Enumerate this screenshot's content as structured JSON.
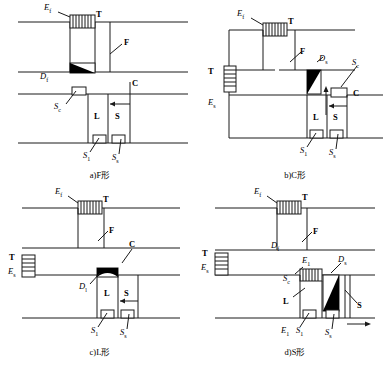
{
  "figure": {
    "title": "",
    "panel_count": 4
  },
  "panels": [
    {
      "id": "a",
      "caption": "a)F形",
      "type": "F-type",
      "labels": {
        "coil_top": "E",
        "coil_top_sub": "f",
        "transformer": "T",
        "frame": "F",
        "diode": "D",
        "diode_sub": "f",
        "sc": "S",
        "sc_sub": "c",
        "c": "C",
        "l": "L",
        "s": "S",
        "s1": "S",
        "s1_sub": "1",
        "ss": "S",
        "ss_sub": "s"
      }
    },
    {
      "id": "b",
      "caption": "b)C形",
      "type": "C-type",
      "labels": {
        "coil_top": "E",
        "coil_top_sub": "f",
        "transformer": "T",
        "frame": "F",
        "transformer_left": "T",
        "coil_left": "E",
        "coil_left_sub": "s",
        "diode": "D",
        "diode_sub": "s",
        "sc": "S",
        "sc_sub": "c",
        "c": "C",
        "l": "L",
        "s": "S",
        "s1": "S",
        "s1_sub": "1",
        "ss": "S",
        "ss_sub": "s"
      }
    },
    {
      "id": "c",
      "caption": "c)L形",
      "type": "L-type",
      "labels": {
        "coil_top": "E",
        "coil_top_sub": "f",
        "transformer": "T",
        "frame": "F",
        "transformer_left": "T",
        "coil_left": "E",
        "coil_left_sub": "s",
        "c": "C",
        "diode": "D",
        "diode_sub": "l",
        "l": "L",
        "s": "S",
        "s1": "S",
        "s1_sub": "1",
        "ss": "S",
        "ss_sub": "s"
      }
    },
    {
      "id": "d",
      "caption": "d)S形",
      "type": "S-type",
      "labels": {
        "coil_top": "E",
        "coil_top_sub": "f",
        "transformer": "T",
        "frame": "F",
        "transformer_left": "T",
        "coil_left": "E",
        "coil_left_sub": "s",
        "df": "D",
        "df_sub": "f",
        "sc": "S",
        "sc_sub": "c",
        "coil_inner": "E",
        "coil_inner_sub": "1",
        "ds": "D",
        "ds_sub": "s",
        "l": "L",
        "s": "S",
        "e1": "E",
        "e1_sub": "1",
        "s1": "S",
        "s1_sub": "1",
        "ss": "S",
        "ss_sub": "s"
      }
    }
  ],
  "style": {
    "line_color": "#1a1a1a",
    "fill_black": "#000000",
    "background": "#ffffff"
  }
}
